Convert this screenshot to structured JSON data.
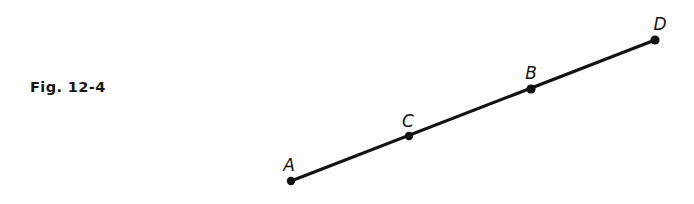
{
  "figure": {
    "caption": "Fig. 12-4",
    "background_color": "#ffffff",
    "ink_color": "#131313",
    "width": 694,
    "height": 204
  },
  "diagram": {
    "type": "line-segment-with-labeled-points",
    "segment": {
      "name": "segment-AD",
      "from": {
        "x": 291,
        "y": 181
      },
      "to": {
        "x": 655,
        "y": 40
      },
      "stroke_width": 3.2
    },
    "points": [
      {
        "id": "A",
        "label": "A",
        "x": 291,
        "y": 181,
        "label_x": 289,
        "label_y": 171,
        "radius": 4.2
      },
      {
        "id": "C",
        "label": "C",
        "x": 409,
        "y": 136,
        "label_x": 408,
        "label_y": 127,
        "radius": 4.2
      },
      {
        "id": "B",
        "label": "B",
        "x": 531,
        "y": 89,
        "label_x": 531,
        "label_y": 79,
        "radius": 4.6
      },
      {
        "id": "D",
        "label": "D",
        "x": 655,
        "y": 40,
        "label_x": 660,
        "label_y": 30,
        "radius": 4.6
      }
    ]
  }
}
